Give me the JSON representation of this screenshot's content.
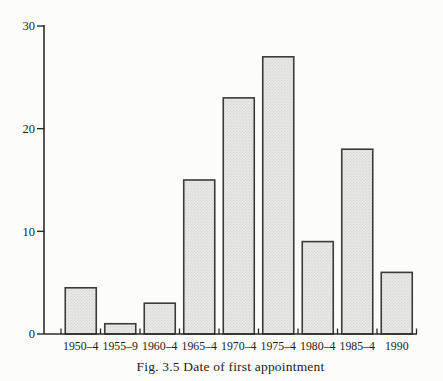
{
  "figure": {
    "caption": "Fig. 3.5 Date of first appointment"
  },
  "chart_data": {
    "type": "bar",
    "categories": [
      "1950–4",
      "1955–9",
      "1960–4",
      "1965–4",
      "1970–4",
      "1975–4",
      "1980–4",
      "1985–4",
      "1990"
    ],
    "values": [
      4.5,
      1,
      3,
      15,
      23,
      27,
      9,
      18,
      6
    ],
    "title": "",
    "caption": "Fig. 3.5 Date of first appointment",
    "xlabel": "",
    "ylabel": "",
    "ylim": [
      0,
      30
    ],
    "yticks": [
      0,
      10,
      20,
      30
    ],
    "grid": false,
    "legend_position": "none"
  },
  "colors": {
    "background": "#fcfcf9",
    "bar_fill_base": "#e9e9e6",
    "bar_fill_dot": "#cbcbc5",
    "bar_border": "#3b3b3b",
    "axis": "#2b2b2b",
    "text": "#1c1c1c"
  }
}
